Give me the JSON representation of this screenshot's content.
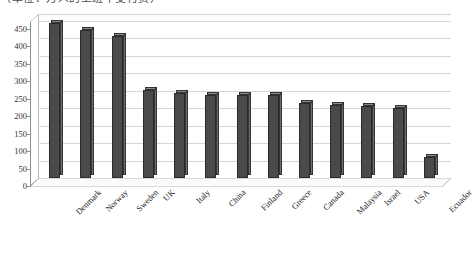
{
  "caption": {
    "text": "（单位：万人的上班不受付费）"
  },
  "chart_data": {
    "type": "bar",
    "title": "",
    "subtitle": "",
    "xlabel": "",
    "ylabel": "",
    "categories": [
      "Denmark",
      "Norway",
      "Sweden",
      "UK",
      "Italy",
      "China",
      "Finland",
      "Greece",
      "Canada",
      "Malaysia",
      "Israel",
      "USA",
      "Ecuador"
    ],
    "values": [
      445,
      425,
      408,
      252,
      243,
      238,
      238,
      238,
      215,
      208,
      205,
      200,
      60
    ],
    "series": [
      {
        "name": "",
        "values": [
          445,
          425,
          408,
          252,
          243,
          238,
          238,
          238,
          215,
          208,
          205,
          200,
          60
        ]
      }
    ],
    "ylim": [
      0,
      470
    ],
    "ytick_values": [
      0,
      50,
      100,
      150,
      200,
      250,
      300,
      350,
      400,
      450
    ],
    "ytick_labels": [
      "0",
      "50",
      "100",
      "150",
      "200",
      "250",
      "300",
      "350",
      "400",
      "450"
    ],
    "grid": true,
    "legend": false,
    "legend_position": "none",
    "bar_color": "#4a4a4a",
    "bar_side_color": "#6e6e6e",
    "bar_top_color": "#8a8a8a",
    "gridline_color": "#d6d6d6",
    "axis_color": "#8f8f8f",
    "background_color": "#ffffff",
    "label_rotation_degrees": -45,
    "three_d": true
  }
}
